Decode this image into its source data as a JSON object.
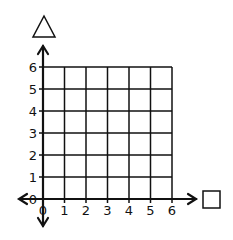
{
  "diagram": {
    "type": "coordinate-grid",
    "x_axis_symbol": "square",
    "y_axis_symbol": "triangle",
    "x_ticks": [
      "0",
      "1",
      "2",
      "3",
      "4",
      "5",
      "6"
    ],
    "y_ticks": [
      "0",
      "1",
      "2",
      "3",
      "4",
      "5",
      "6"
    ],
    "x_range": [
      0,
      6
    ],
    "y_range": [
      0,
      6
    ],
    "line_color": "#111111",
    "background": "#ffffff"
  }
}
